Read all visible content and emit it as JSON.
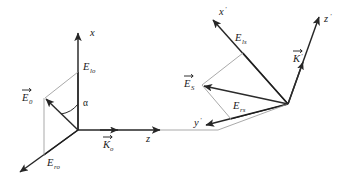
{
  "figure": {
    "type": "vector-diagram",
    "background_color": "#ffffff",
    "line_color": "#262626",
    "construction_color": "#9a9a9a",
    "width": 339,
    "height": 183
  },
  "left_system": {
    "name": "unprimed-frame",
    "origin_label": "O",
    "axes": [
      {
        "id": "x-axis",
        "label": "x",
        "prime": "",
        "direction": "up"
      },
      {
        "id": "z-axis",
        "label": "z",
        "prime": "",
        "direction": "right"
      },
      {
        "id": "y-axis",
        "label": "",
        "prime": "",
        "direction": "down-left"
      }
    ],
    "vectors": [
      {
        "id": "E0",
        "label": "E",
        "subscript": "0",
        "arrow": true
      },
      {
        "id": "K0",
        "label": "K",
        "subscript": "o",
        "arrow": true
      }
    ],
    "components": [
      {
        "id": "Elo",
        "label": "E",
        "subscript": "lo",
        "arrow": false
      },
      {
        "id": "Ero",
        "label": "E",
        "subscript": "ro",
        "arrow": false
      }
    ],
    "angle": {
      "id": "alpha",
      "label": "α"
    }
  },
  "right_system": {
    "name": "primed-frame",
    "origin_label": "O'",
    "axes": [
      {
        "id": "x-prime-axis",
        "label": "x",
        "prime": "′",
        "direction": "up-left"
      },
      {
        "id": "z-prime-axis",
        "label": "z",
        "prime": "′",
        "direction": "up-right"
      },
      {
        "id": "y-prime-axis",
        "label": "y",
        "prime": "′",
        "direction": "down-left"
      }
    ],
    "vectors": [
      {
        "id": "ES",
        "label": "E",
        "subscript": "S",
        "arrow": true
      },
      {
        "id": "Kprime",
        "label": "K",
        "subscript": "",
        "prime": "′",
        "arrow": true
      }
    ],
    "components": [
      {
        "id": "Els",
        "label": "E",
        "subscript": "ls",
        "arrow": false
      },
      {
        "id": "Ers",
        "label": "E",
        "subscript": "rs",
        "arrow": false
      }
    ]
  },
  "labels": {
    "x": "x",
    "z": "z",
    "x_prime": "x",
    "y_prime": "y",
    "z_prime": "z",
    "prime_mark": "′",
    "E": "E",
    "K": "K",
    "sub_0": "0",
    "sub_o": "o",
    "sub_S": "S",
    "sub_lo": "lo",
    "sub_ro": "ro",
    "sub_ls": "ls",
    "sub_rs": "rs",
    "alpha": "α"
  }
}
